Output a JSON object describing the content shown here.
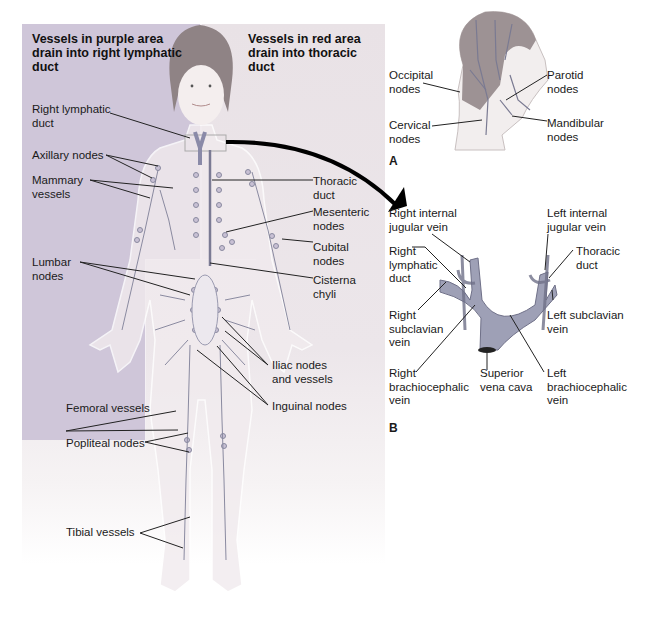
{
  "figure": {
    "main": {
      "header_left": "Vessels in purple area\ndrain into right lymphatic\nduct",
      "header_right": "Vessels in red area\ndrain into thoracic\nduct",
      "labels_left": [
        {
          "id": "right-lymphatic-duct",
          "text": "Right lymphatic\nduct"
        },
        {
          "id": "axillary-nodes",
          "text": "Axillary nodes"
        },
        {
          "id": "mammary-vessels",
          "text": "Mammary\nvessels"
        },
        {
          "id": "lumbar-nodes",
          "text": "Lumbar\nnodes"
        },
        {
          "id": "femoral-vessels",
          "text": "Femoral vessels"
        },
        {
          "id": "popliteal-nodes",
          "text": "Popliteal nodes"
        },
        {
          "id": "tibial-vessels",
          "text": "Tibial vessels"
        }
      ],
      "labels_right": [
        {
          "id": "thoracic-duct",
          "text": "Thoracic\nduct"
        },
        {
          "id": "mesenteric-nodes",
          "text": "Mesenteric\nnodes"
        },
        {
          "id": "cubital-nodes",
          "text": "Cubital\nnodes"
        },
        {
          "id": "cisterna-chyli",
          "text": "Cisterna\nchyli"
        },
        {
          "id": "iliac-nodes",
          "text": "Iliac nodes\nand vessels"
        },
        {
          "id": "inguinal-nodes",
          "text": "Inguinal nodes"
        }
      ]
    },
    "panel_a": {
      "letter": "A",
      "labels": [
        {
          "id": "occipital-nodes",
          "text": "Occipital\nnodes"
        },
        {
          "id": "parotid-nodes",
          "text": "Parotid\nnodes"
        },
        {
          "id": "cervical-nodes",
          "text": "Cervical\nnodes"
        },
        {
          "id": "mandibular-nodes",
          "text": "Mandibular\nnodes"
        }
      ]
    },
    "panel_b": {
      "letter": "B",
      "labels": [
        {
          "id": "right-internal-jugular",
          "text": "Right internal\njugular vein"
        },
        {
          "id": "left-internal-jugular",
          "text": "Left internal\njugular vein"
        },
        {
          "id": "right-lymphatic-duct-b",
          "text": "Right\nlymphatic\nduct"
        },
        {
          "id": "thoracic-duct-b",
          "text": "Thoracic\nduct"
        },
        {
          "id": "right-subclavian",
          "text": "Right\nsubclavian\nvein"
        },
        {
          "id": "left-subclavian",
          "text": "Left subclavian\nvein"
        },
        {
          "id": "right-brachiocephalic",
          "text": "Right\nbrachiocephalic\nvein"
        },
        {
          "id": "superior-vena-cava",
          "text": "Superior\nvena cava"
        },
        {
          "id": "left-brachiocephalic",
          "text": "Left\nbrachiocephalic\nvein"
        }
      ]
    },
    "colors": {
      "purple_region": "#cfc6d9",
      "red_region": "#ece6ea",
      "vessel": "#8a8aa0",
      "vein": "#9a9db4",
      "node": "#b7aec8",
      "skin": "#f3eeee",
      "hair": "#8c8080"
    }
  }
}
